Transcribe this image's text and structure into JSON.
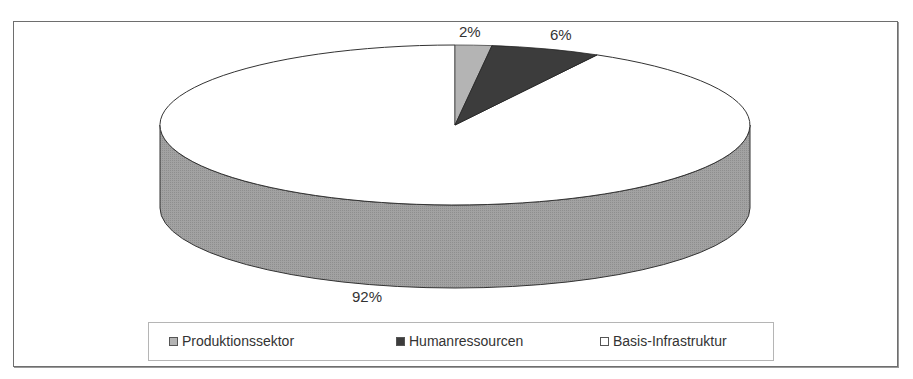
{
  "chart_data": {
    "type": "pie",
    "style": "3d",
    "title": "",
    "categories": [
      "Produktionssektor",
      "Humanressourcen",
      "Basis-Infrastruktur"
    ],
    "values": [
      2,
      6,
      92
    ],
    "unit": "%",
    "data_labels": [
      "2%",
      "6%",
      "92%"
    ],
    "colors": [
      "#b4b4b4",
      "#3c3c3c",
      "#ffffff"
    ],
    "side_color": "#a0a0a0",
    "legend_position": "bottom"
  },
  "labels": {
    "p0": "2%",
    "p1": "6%",
    "p2": "92%"
  },
  "legend": {
    "items": [
      {
        "label": "Produktionssektor",
        "color": "#b4b4b4"
      },
      {
        "label": "Humanressourcen",
        "color": "#3c3c3c"
      },
      {
        "label": "Basis-Infrastruktur",
        "color": "#ffffff"
      }
    ]
  }
}
